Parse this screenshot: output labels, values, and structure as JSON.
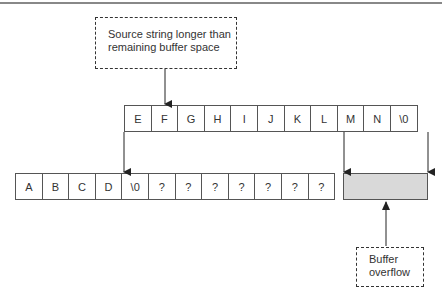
{
  "callouts": {
    "source": "Source string longer than remaining buffer space",
    "overflow": "Buffer overflow"
  },
  "source_string": [
    "E",
    "F",
    "G",
    "H",
    "I",
    "J",
    "K",
    "L",
    "M",
    "N",
    "\\0"
  ],
  "buffer": [
    "A",
    "B",
    "C",
    "D",
    "\\0",
    "?",
    "?",
    "?",
    "?",
    "?",
    "?",
    "?"
  ],
  "colors": {
    "overflow_fill": "#d9d9d9",
    "line": "#333333"
  }
}
